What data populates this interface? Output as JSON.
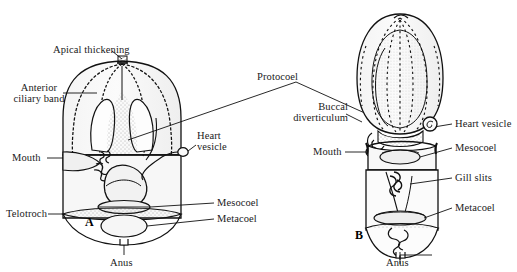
{
  "figure": {
    "type": "scientific-illustration",
    "background_color": "#ffffff",
    "ink_color": "#111111",
    "panels": [
      {
        "letter": "A",
        "name": "tornaria-larva",
        "description": "Dome-shaped larva with anterior ciliary band, apical thickening and telotroch"
      },
      {
        "letter": "B",
        "name": "juvenile-acorn-worm",
        "description": "Ovoid proboscis with collar and trunk showing gill slits"
      }
    ]
  },
  "labels_panel_a": {
    "apical_thickening": "Apical thickening",
    "anterior_ciliary_band_line1": "Anterior",
    "anterior_ciliary_band_line2": "ciliary band",
    "mouth": "Mouth",
    "telotroch": "Telotroch",
    "heart_vesicle_line1": "Heart",
    "heart_vesicle_line2": "vesicle",
    "mesocoel": "Mesocoel",
    "metacoel": "Metacoel",
    "anus": "Anus"
  },
  "labels_shared": {
    "protocoel": "Protocoel"
  },
  "labels_panel_b": {
    "buccal_diverticulum_line1": "Buccal",
    "buccal_diverticulum_line2": "diverticulum",
    "mouth": "Mouth",
    "heart_vesicle": "Heart  vesicle",
    "mesocoel": "Mesocoel",
    "gill_slits": "Gill  slits",
    "metacoel": "Metacoel",
    "anus": "Anus"
  }
}
